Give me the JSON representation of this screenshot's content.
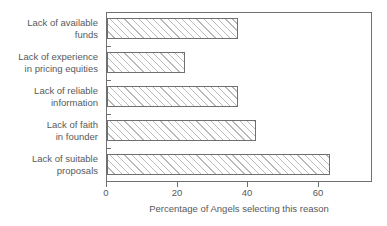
{
  "chart_data": {
    "type": "bar",
    "orientation": "horizontal",
    "title": "",
    "subtitle": "",
    "xlabel": "Percentage of Angels selecting this reason",
    "ylabel": "",
    "categories": [
      "Lack of available\nfunds",
      "Lack of experience\nin pricing equities",
      "Lack of reliable\ninformation",
      "Lack of faith\nin founder",
      "Lack of suitable\nproposals"
    ],
    "values": [
      37,
      22,
      37,
      42,
      63
    ],
    "xlim": [
      0,
      75
    ],
    "x_ticks": [
      0,
      20,
      40,
      60
    ],
    "x_tick_labels": [
      "0",
      "20",
      "40",
      "60"
    ],
    "grid": false,
    "legend": null,
    "bar_style": {
      "fill": "#ffffff",
      "hatch": "/",
      "hatch_color": "#b9babc",
      "edge_color": "#6e6f71"
    }
  },
  "axis": {
    "frame_color": "#6e6f71",
    "text_color": "#58595b"
  }
}
